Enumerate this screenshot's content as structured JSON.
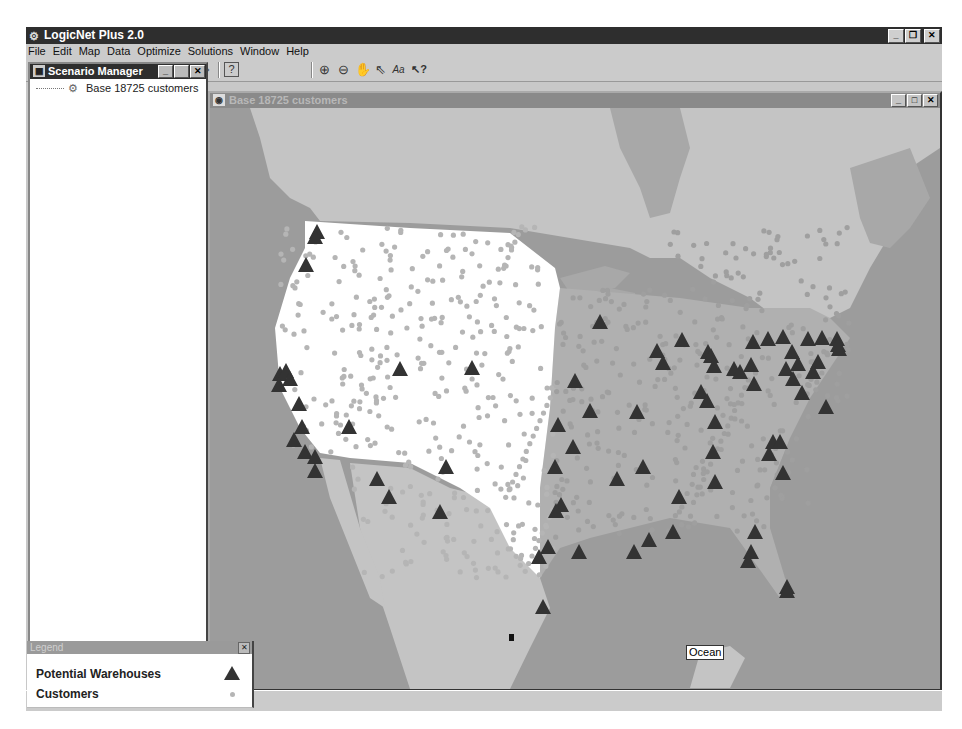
{
  "app": {
    "title": "LogicNet Plus 2.0",
    "window_buttons": {
      "minimize": "_",
      "restore": "❐",
      "close": "✕"
    }
  },
  "menu": [
    "File",
    "Edit",
    "Map",
    "Data",
    "Optimize",
    "Solutions",
    "Window",
    "Help"
  ],
  "toolbar": {
    "buttons": [
      {
        "name": "new-icon",
        "glyph": "🗋"
      },
      {
        "name": "open-icon",
        "glyph": "📂"
      },
      {
        "name": "save-icon",
        "glyph": "💾"
      },
      {
        "name": "copy-icon",
        "glyph": "⎘"
      },
      {
        "name": "paste-icon",
        "glyph": "📋"
      },
      {
        "name": "optimize-icon",
        "glyph": "◉"
      },
      {
        "name": "report-icon",
        "glyph": "🗎"
      },
      {
        "name": "export-icon",
        "glyph": "⇨"
      },
      {
        "name": "help-icon",
        "glyph": "?"
      },
      {
        "name": "zoom-in-icon",
        "glyph": "⊕"
      },
      {
        "name": "zoom-out-icon",
        "glyph": "⊖"
      },
      {
        "name": "pan-hand-icon",
        "glyph": "✋"
      },
      {
        "name": "select-pointer-icon",
        "glyph": "⇖"
      },
      {
        "name": "label-text-icon",
        "glyph": "Aa"
      },
      {
        "name": "context-help-icon",
        "glyph": "↖?"
      }
    ]
  },
  "scenario_manager": {
    "title": "Scenario Manager",
    "items": [
      {
        "label": "Base 18725 customers"
      }
    ]
  },
  "map_window": {
    "title": "Base 18725 customers",
    "ocean_label": "Ocean",
    "colors": {
      "ocean": "#9c9c9c",
      "land_foreign": "#c4c4c4",
      "us_land": "#ffffff",
      "us_east_land": "#b0b0b0",
      "customer_dot": "#b5b5b5",
      "warehouse": "#333333"
    }
  },
  "legend": {
    "title": "Legend",
    "items": [
      {
        "label": "Potential Warehouses",
        "symbol": "triangle"
      },
      {
        "label": "Customers",
        "symbol": "dot"
      }
    ]
  },
  "warehouses": [
    [
      107,
      125
    ],
    [
      105,
      130
    ],
    [
      96,
      158
    ],
    [
      70,
      267
    ],
    [
      76,
      264
    ],
    [
      69,
      278
    ],
    [
      80,
      272
    ],
    [
      89,
      297
    ],
    [
      92,
      320
    ],
    [
      84,
      333
    ],
    [
      95,
      345
    ],
    [
      105,
      350
    ],
    [
      105,
      364
    ],
    [
      139,
      320
    ],
    [
      190,
      262
    ],
    [
      167,
      372
    ],
    [
      179,
      390
    ],
    [
      236,
      360
    ],
    [
      230,
      405
    ],
    [
      262,
      261
    ],
    [
      348,
      318
    ],
    [
      365,
      274
    ],
    [
      380,
      304
    ],
    [
      363,
      340
    ],
    [
      345,
      360
    ],
    [
      351,
      398
    ],
    [
      346,
      404
    ],
    [
      338,
      440
    ],
    [
      329,
      450
    ],
    [
      369,
      445
    ],
    [
      333,
      500
    ],
    [
      390,
      215
    ],
    [
      407,
      372
    ],
    [
      427,
      305
    ],
    [
      433,
      360
    ],
    [
      447,
      244
    ],
    [
      453,
      256
    ],
    [
      469,
      390
    ],
    [
      472,
      233
    ],
    [
      498,
      245
    ],
    [
      491,
      285
    ],
    [
      497,
      294
    ],
    [
      501,
      249
    ],
    [
      504,
      259
    ],
    [
      505,
      315
    ],
    [
      503,
      345
    ],
    [
      505,
      375
    ],
    [
      524,
      262
    ],
    [
      530,
      265
    ],
    [
      541,
      258
    ],
    [
      544,
      277
    ],
    [
      543,
      235
    ],
    [
      558,
      232
    ],
    [
      573,
      230
    ],
    [
      559,
      347
    ],
    [
      563,
      335
    ],
    [
      573,
      366
    ],
    [
      570,
      335
    ],
    [
      576,
      262
    ],
    [
      583,
      272
    ],
    [
      582,
      245
    ],
    [
      588,
      257
    ],
    [
      598,
      232
    ],
    [
      592,
      286
    ],
    [
      608,
      255
    ],
    [
      603,
      265
    ],
    [
      612,
      231
    ],
    [
      616,
      300
    ],
    [
      627,
      232
    ],
    [
      629,
      242
    ],
    [
      628,
      238
    ],
    [
      424,
      445
    ],
    [
      439,
      433
    ],
    [
      463,
      425
    ],
    [
      545,
      425
    ],
    [
      541,
      445
    ],
    [
      538,
      454
    ],
    [
      577,
      480
    ],
    [
      577,
      484
    ]
  ]
}
